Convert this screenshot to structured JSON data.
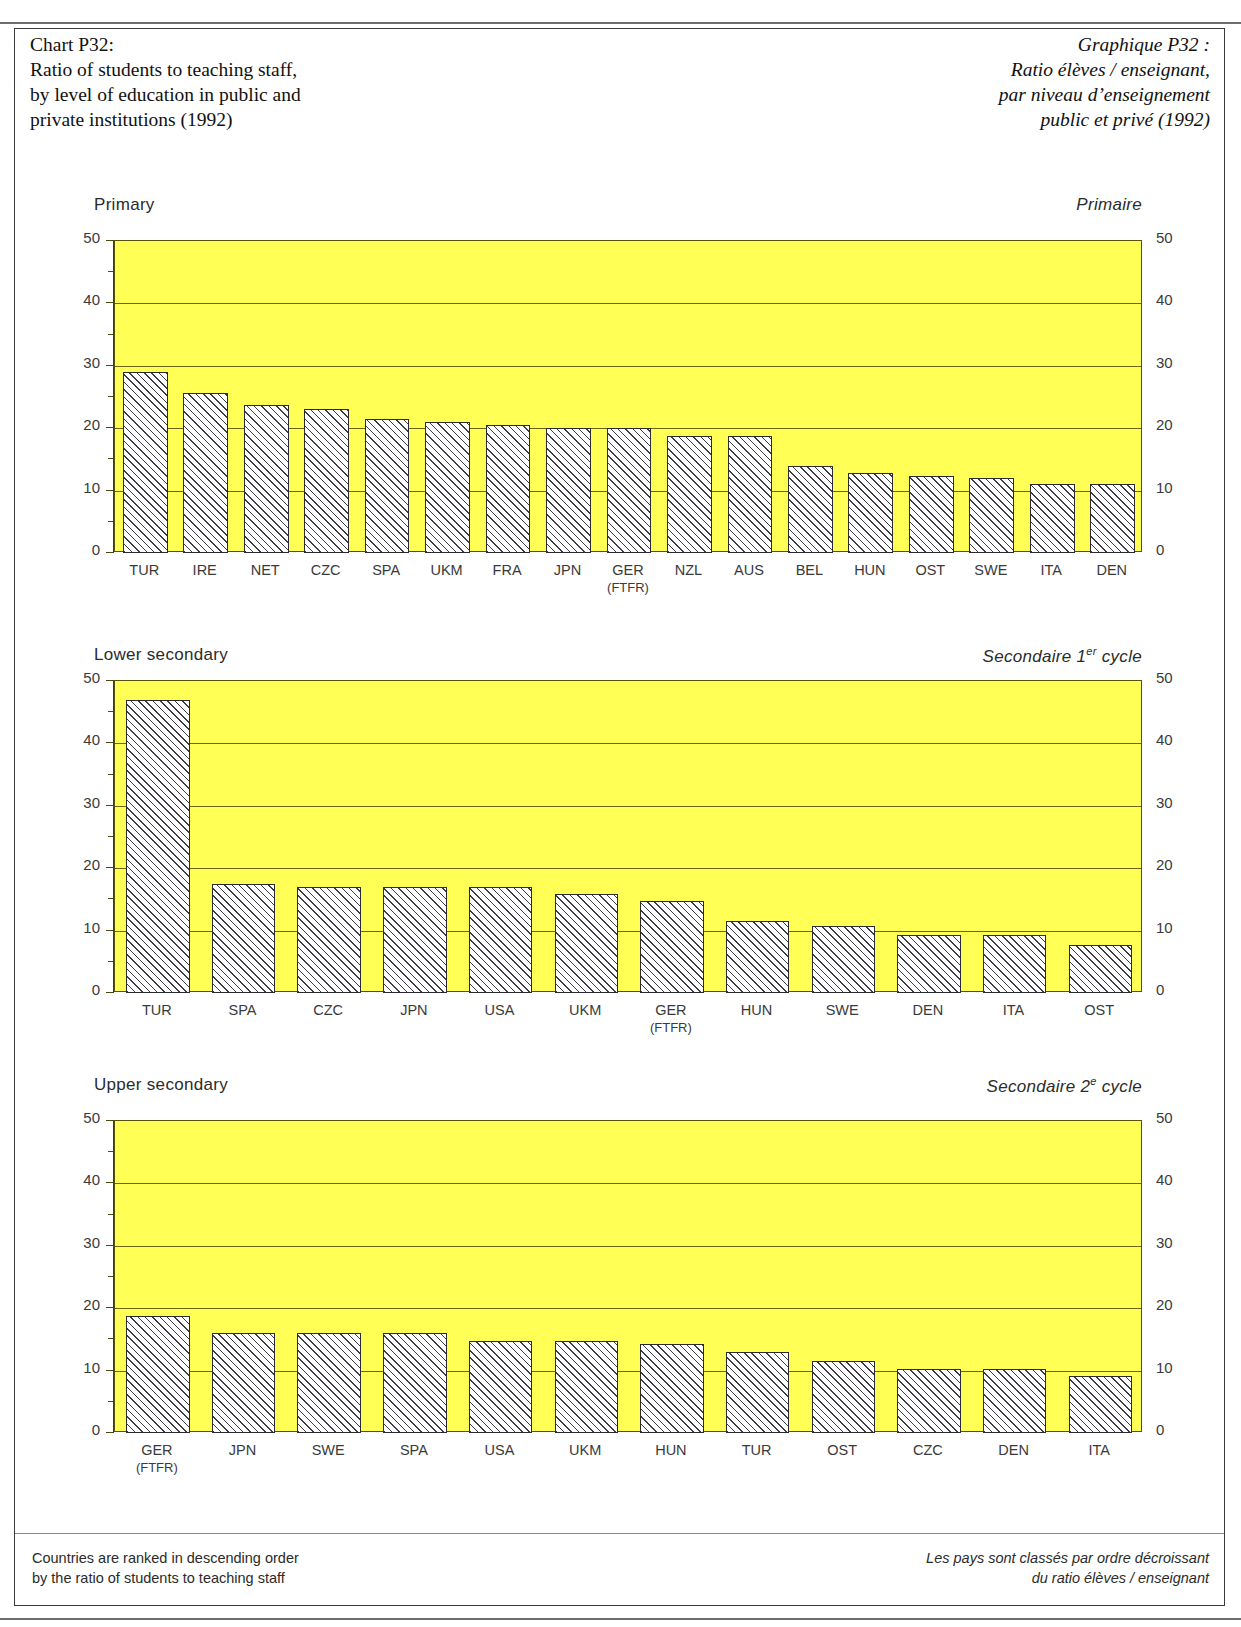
{
  "header": {
    "left_lines": [
      "Chart P32:",
      "Ratio of students to teaching staff,",
      "by level of education in public and",
      "private institutions (1992)"
    ],
    "right_lines": [
      "Graphique P32 :",
      "Ratio élèves / enseignant,",
      "par niveau d’enseignement",
      "public et privé (1992)"
    ]
  },
  "footer": {
    "left_lines": [
      "Countries are ranked in descending order",
      "by the ratio of students to teaching staff"
    ],
    "right_lines": [
      "Les pays sont classés par ordre décroissant",
      "du ratio élèves / enseignant"
    ]
  },
  "axis": {
    "ticks": [
      "50",
      "40",
      "30",
      "20",
      "10",
      "0"
    ],
    "ymin": 0,
    "ymax": 50
  },
  "colors": {
    "plot_background": "#ffff55",
    "bar_fill": "#ffffff",
    "bar_hatch": "#3c3c4a",
    "gridline": "#6b6410",
    "frame": "#3a3a3a",
    "text": "#2b2b2b"
  },
  "chart_data": [
    {
      "type": "bar",
      "title": "Primary",
      "title_fr": "Primaire",
      "xlabel": "",
      "ylabel": "",
      "ylim": [
        0,
        50
      ],
      "yticks": [
        0,
        10,
        20,
        30,
        40,
        50
      ],
      "grid": true,
      "legend": "none",
      "categories": [
        "TUR",
        "IRE",
        "NET",
        "CZC",
        "SPA",
        "UKM",
        "GER\n(FTFR)",
        "JPN",
        "GER\n(FTFR)",
        "NZL",
        "AUS",
        "BEL",
        "HUN",
        "OST",
        "SWE",
        "ITA",
        "DEN"
      ],
      "labels": [
        {
          "code": "TUR",
          "sub": ""
        },
        {
          "code": "IRE",
          "sub": ""
        },
        {
          "code": "NET",
          "sub": ""
        },
        {
          "code": "CZC",
          "sub": ""
        },
        {
          "code": "SPA",
          "sub": ""
        },
        {
          "code": "UKM",
          "sub": ""
        },
        {
          "code": "FRA",
          "sub": ""
        },
        {
          "code": "JPN",
          "sub": ""
        },
        {
          "code": "GER",
          "sub": "(FTFR)"
        },
        {
          "code": "NZL",
          "sub": ""
        },
        {
          "code": "AUS",
          "sub": ""
        },
        {
          "code": "BEL",
          "sub": ""
        },
        {
          "code": "HUN",
          "sub": ""
        },
        {
          "code": "OST",
          "sub": ""
        },
        {
          "code": "SWE",
          "sub": ""
        },
        {
          "code": "ITA",
          "sub": ""
        },
        {
          "code": "DEN",
          "sub": ""
        }
      ],
      "values": [
        29.0,
        25.7,
        23.8,
        23.0,
        21.5,
        21.0,
        20.5,
        20.0,
        20.0,
        18.7,
        18.7,
        14.0,
        12.8,
        12.4,
        12.0,
        11.0,
        11.0
      ]
    },
    {
      "type": "bar",
      "title": "Lower secondary",
      "title_fr": "Secondaire 1er cycle",
      "title_fr_main": "Secondaire 1",
      "title_fr_sup": "er",
      "title_fr_tail": " cycle",
      "xlabel": "",
      "ylabel": "",
      "ylim": [
        0,
        50
      ],
      "yticks": [
        0,
        10,
        20,
        30,
        40,
        50
      ],
      "grid": true,
      "legend": "none",
      "labels": [
        {
          "code": "TUR",
          "sub": ""
        },
        {
          "code": "SPA",
          "sub": ""
        },
        {
          "code": "CZC",
          "sub": ""
        },
        {
          "code": "JPN",
          "sub": ""
        },
        {
          "code": "USA",
          "sub": ""
        },
        {
          "code": "UKM",
          "sub": ""
        },
        {
          "code": "GER",
          "sub": "(FTFR)"
        },
        {
          "code": "HUN",
          "sub": ""
        },
        {
          "code": "SWE",
          "sub": ""
        },
        {
          "code": "DEN",
          "sub": ""
        },
        {
          "code": "ITA",
          "sub": ""
        },
        {
          "code": "OST",
          "sub": ""
        }
      ],
      "values": [
        47.0,
        17.5,
        17.0,
        17.0,
        17.0,
        15.9,
        14.8,
        11.6,
        10.7,
        9.3,
        9.3,
        7.7
      ]
    },
    {
      "type": "bar",
      "title": "Upper secondary",
      "title_fr": "Secondaire 2e cycle",
      "title_fr_main": "Secondaire 2",
      "title_fr_sup": "e",
      "title_fr_tail": " cycle",
      "xlabel": "",
      "ylabel": "",
      "ylim": [
        0,
        50
      ],
      "yticks": [
        0,
        10,
        20,
        30,
        40,
        50
      ],
      "grid": true,
      "legend": "none",
      "labels": [
        {
          "code": "GER",
          "sub": "(FTFR)"
        },
        {
          "code": "JPN",
          "sub": ""
        },
        {
          "code": "SWE",
          "sub": ""
        },
        {
          "code": "SPA",
          "sub": ""
        },
        {
          "code": "USA",
          "sub": ""
        },
        {
          "code": "UKM",
          "sub": ""
        },
        {
          "code": "HUN",
          "sub": ""
        },
        {
          "code": "TUR",
          "sub": ""
        },
        {
          "code": "OST",
          "sub": ""
        },
        {
          "code": "CZC",
          "sub": ""
        },
        {
          "code": "DEN",
          "sub": ""
        },
        {
          "code": "ITA",
          "sub": ""
        }
      ],
      "values": [
        18.7,
        16.0,
        16.0,
        16.0,
        14.8,
        14.8,
        14.2,
        13.0,
        11.5,
        10.2,
        10.2,
        9.2
      ]
    }
  ]
}
